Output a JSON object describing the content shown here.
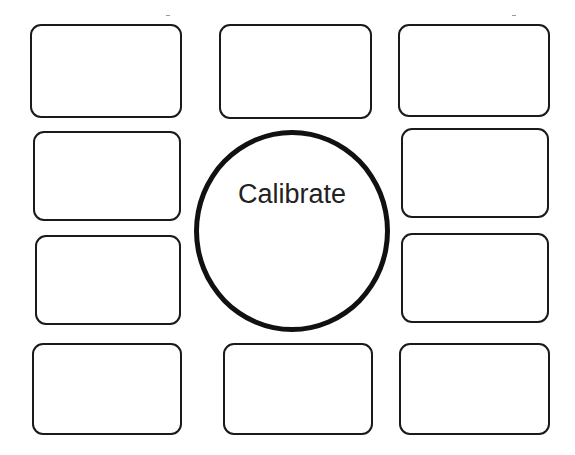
{
  "calibrate": {
    "label": "Calibrate"
  },
  "tiles": [
    {
      "id": "r1c1"
    },
    {
      "id": "r1c2"
    },
    {
      "id": "r1c3"
    },
    {
      "id": "r2c1"
    },
    {
      "id": "r2c3"
    },
    {
      "id": "r3c1"
    },
    {
      "id": "r3c3"
    },
    {
      "id": "r4c1"
    },
    {
      "id": "r4c2"
    },
    {
      "id": "r4c3"
    }
  ]
}
